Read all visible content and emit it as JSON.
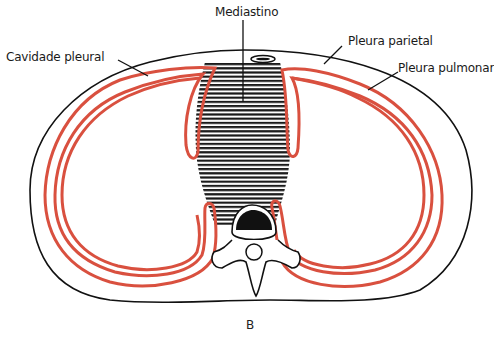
{
  "diagram": {
    "caption": "B",
    "labels": {
      "mediastino": "Mediastino",
      "cavidade_pleural": "Cavidade pleural",
      "pleura_parietal": "Pleura parietal",
      "pleura_pulmonar": "Pleura pulmonar"
    },
    "colors": {
      "pleura": "#d9503f",
      "outline": "#111111",
      "background": "#ffffff",
      "hatch": "#1a1a1a"
    }
  }
}
